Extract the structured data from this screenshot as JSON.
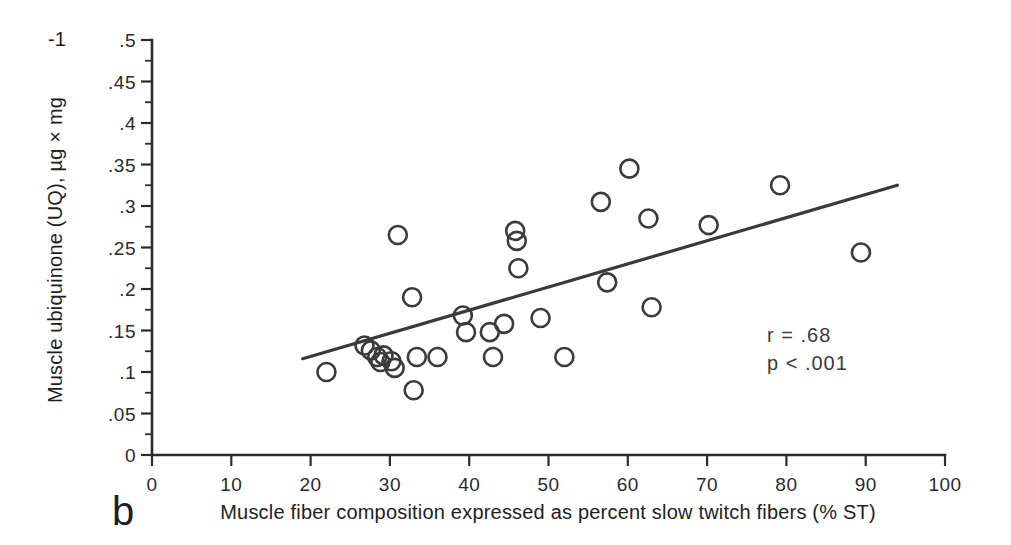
{
  "figure": {
    "panel_label": "b",
    "background_color": "#ffffff",
    "ink_color": "#3a3a3a"
  },
  "annotations": {
    "correlation": "r = .68",
    "significance": "p < .001"
  },
  "chart_data": {
    "type": "scatter",
    "title": "",
    "xlabel": "Muscle fiber composition expressed as percent slow twitch fibers (% ST)",
    "ylabel": "Muscle ubiquinone (UQ), µg × mg",
    "ylabel_exponent": "-1",
    "xlim": [
      0,
      100
    ],
    "ylim": [
      0,
      0.5
    ],
    "xticks": [
      0,
      10,
      20,
      30,
      40,
      50,
      60,
      70,
      80,
      90,
      100
    ],
    "xtick_labels": [
      "0",
      "10",
      "20",
      "30",
      "40",
      "50",
      "60",
      "70",
      "80",
      "90",
      "100"
    ],
    "yticks": [
      0,
      0.05,
      0.1,
      0.15,
      0.2,
      0.25,
      0.3,
      0.35,
      0.4,
      0.45,
      0.5
    ],
    "ytick_labels": [
      "0",
      ".05",
      ".1",
      ".15",
      ".2",
      ".25",
      ".3",
      ".35",
      ".4",
      ".45",
      ".5"
    ],
    "y_minor_step": 0.025,
    "grid": false,
    "legend": null,
    "marker": "open-circle",
    "marker_radius_px": 9,
    "points": [
      {
        "x": 22.0,
        "y": 0.1
      },
      {
        "x": 26.8,
        "y": 0.132
      },
      {
        "x": 27.6,
        "y": 0.126
      },
      {
        "x": 28.4,
        "y": 0.118
      },
      {
        "x": 28.8,
        "y": 0.112
      },
      {
        "x": 29.2,
        "y": 0.12
      },
      {
        "x": 30.2,
        "y": 0.113
      },
      {
        "x": 30.6,
        "y": 0.105
      },
      {
        "x": 31.0,
        "y": 0.265
      },
      {
        "x": 32.8,
        "y": 0.19
      },
      {
        "x": 33.0,
        "y": 0.078
      },
      {
        "x": 33.4,
        "y": 0.118
      },
      {
        "x": 36.0,
        "y": 0.118
      },
      {
        "x": 39.2,
        "y": 0.168
      },
      {
        "x": 39.6,
        "y": 0.148
      },
      {
        "x": 42.6,
        "y": 0.148
      },
      {
        "x": 43.0,
        "y": 0.118
      },
      {
        "x": 44.4,
        "y": 0.158
      },
      {
        "x": 45.8,
        "y": 0.27
      },
      {
        "x": 46.0,
        "y": 0.258
      },
      {
        "x": 46.2,
        "y": 0.225
      },
      {
        "x": 49.0,
        "y": 0.165
      },
      {
        "x": 52.0,
        "y": 0.118
      },
      {
        "x": 56.6,
        "y": 0.305
      },
      {
        "x": 57.4,
        "y": 0.208
      },
      {
        "x": 60.2,
        "y": 0.345
      },
      {
        "x": 62.6,
        "y": 0.285
      },
      {
        "x": 63.0,
        "y": 0.178
      },
      {
        "x": 70.2,
        "y": 0.277
      },
      {
        "x": 79.2,
        "y": 0.325
      },
      {
        "x": 89.4,
        "y": 0.244
      }
    ],
    "regression_line": {
      "x_start": 19.0,
      "y_start": 0.116,
      "x_end": 94.0,
      "y_end": 0.325
    }
  }
}
